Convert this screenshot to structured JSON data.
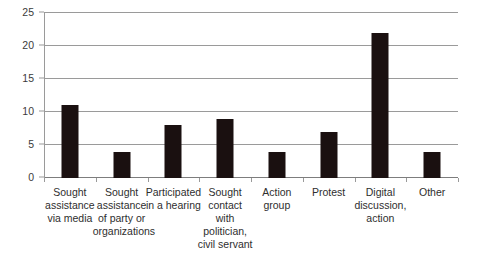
{
  "chart_data": {
    "type": "bar",
    "title": "",
    "subtitle": "",
    "xlabel": "",
    "ylabel": "",
    "ylim": [
      0,
      25
    ],
    "grid": true,
    "legend": false,
    "legend_position": "none",
    "bar_color": "#1a1010",
    "gridline_color": "#9a9a9a",
    "axis_color": "#9a9a9a",
    "background_color": "#ffffff",
    "yticks": [
      0,
      5,
      10,
      15,
      20,
      25
    ],
    "ytick_labels": [
      "0",
      "5",
      "10",
      "15",
      "20",
      "25"
    ],
    "categories": [
      "Sought assistance via media",
      "Sought assistance of party or organizations",
      "Participated in a hearing",
      "Sought contact with politician, civil servant",
      "Action group",
      "Protest",
      "Digital discussion, action",
      "Other"
    ],
    "category_lines": [
      [
        "Sought",
        "assistance",
        "via media"
      ],
      [
        "Sought",
        "assistance",
        "of party or",
        "organizations"
      ],
      [
        "Participated",
        "in a hearing"
      ],
      [
        "Sought",
        "contact",
        "with",
        "politician,",
        "civil servant"
      ],
      [
        "Action",
        "group"
      ],
      [
        "Protest"
      ],
      [
        "Digital",
        "discussion,",
        "action"
      ],
      [
        "Other"
      ]
    ],
    "values": [
      11,
      4,
      8,
      9,
      4,
      7,
      22,
      4
    ]
  }
}
